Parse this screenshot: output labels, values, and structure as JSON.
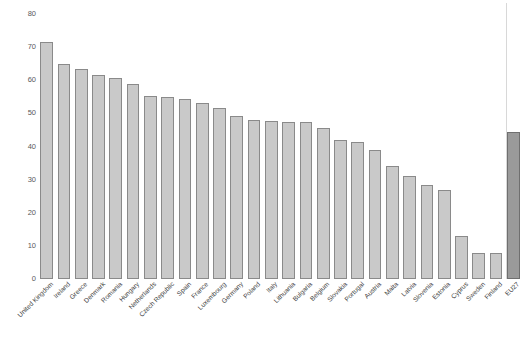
{
  "chart_data": {
    "type": "bar",
    "title": "",
    "subtitle": "",
    "xlabel": "",
    "ylabel": "Proportion of population (%)",
    "ylim": [
      0,
      80
    ],
    "yticks": [
      0,
      10,
      20,
      30,
      40,
      50,
      60,
      70,
      80
    ],
    "grid": false,
    "legend": null,
    "categories": [
      "United Kingdom",
      "Ireland",
      "Greece",
      "Denmark",
      "Romania",
      "Hungary",
      "Netherlands",
      "Czech Republic",
      "Spain",
      "France",
      "Luxembourg",
      "Germany",
      "Poland",
      "Italy",
      "Lithuania",
      "Bulgaria",
      "Belgium",
      "Slovakia",
      "Portugal",
      "Austria",
      "Malta",
      "Latvia",
      "Slovenia",
      "Estonia",
      "Cyprus",
      "Sweden",
      "Finland",
      "EU27"
    ],
    "values": [
      71.7,
      65.0,
      63.3,
      61.5,
      60.7,
      58.8,
      55.3,
      55.0,
      54.3,
      53.0,
      51.5,
      49.3,
      48.0,
      47.7,
      47.5,
      47.5,
      45.5,
      42.0,
      41.5,
      39.0,
      34.0,
      31.0,
      28.5,
      27.0,
      13.0,
      8.0,
      8.0,
      44.3
    ],
    "highlight_index": 27,
    "separator_before_index": 27,
    "colors": {
      "bar_fill": "#c9c9c9",
      "bar_edge": "#8a8a8a",
      "highlight_fill": "#9a9a9a",
      "highlight_edge": "#6f6f6f",
      "background": "#ffffff",
      "text": "#3d3d3d",
      "separator": "#d8d8d8"
    }
  }
}
